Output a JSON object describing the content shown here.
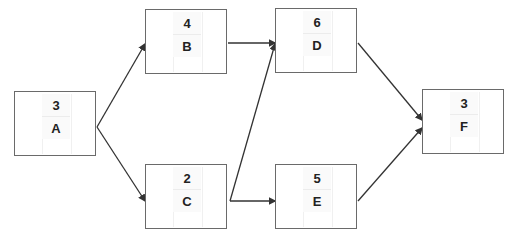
{
  "diagram": {
    "type": "activity-on-node network",
    "nodes": [
      {
        "id": "A",
        "duration": "3",
        "x": 14,
        "y": 91
      },
      {
        "id": "B",
        "duration": "4",
        "x": 145,
        "y": 9
      },
      {
        "id": "C",
        "duration": "2",
        "x": 145,
        "y": 164
      },
      {
        "id": "D",
        "duration": "6",
        "x": 275,
        "y": 8
      },
      {
        "id": "E",
        "duration": "5",
        "x": 275,
        "y": 164
      },
      {
        "id": "F",
        "duration": "3",
        "x": 422,
        "y": 89
      }
    ],
    "edges": [
      {
        "from": "A",
        "to": "B"
      },
      {
        "from": "A",
        "to": "C"
      },
      {
        "from": "B",
        "to": "D"
      },
      {
        "from": "C",
        "to": "D"
      },
      {
        "from": "C",
        "to": "E"
      },
      {
        "from": "D",
        "to": "F"
      },
      {
        "from": "E",
        "to": "F"
      }
    ],
    "colors": {
      "line": "#333333",
      "border": "#6a6a6a",
      "text": "#222222"
    }
  }
}
